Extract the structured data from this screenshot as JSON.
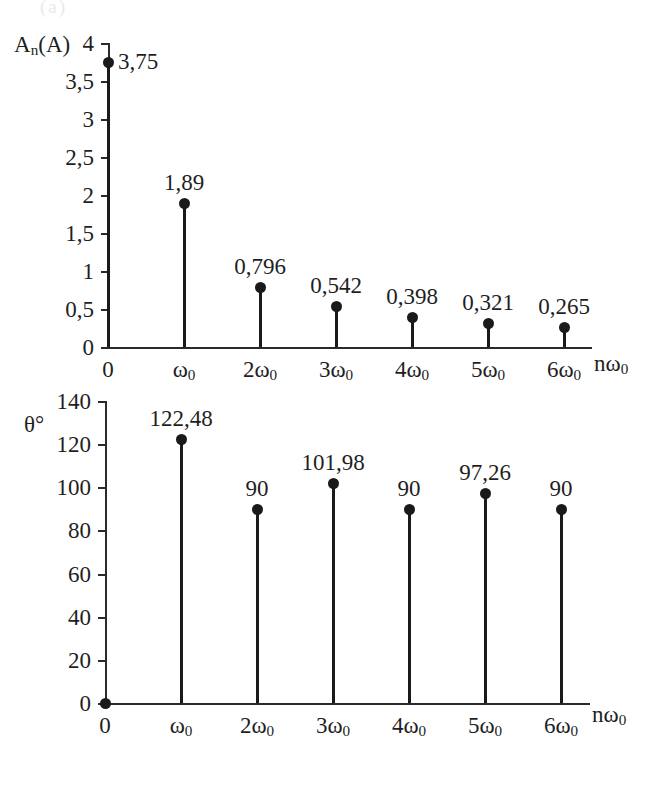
{
  "figure": {
    "cropped_caption_fragment": "(a)",
    "background_color": "#ffffff",
    "ink_color": "#1a1a1a"
  },
  "chart_data": [
    {
      "type": "bar",
      "style": "stem",
      "title": "",
      "subtitle": "",
      "xlabel": "nω0",
      "ylabel": "An(A)",
      "ylabel_display": "A",
      "ylabel_sub": "n",
      "ylabel_tail": "(A)",
      "categories": [
        "0",
        "ω0",
        "2ω0",
        "3ω0",
        "4ω0",
        "5ω0",
        "6ω0"
      ],
      "xtick_labels": [
        "0",
        "ω",
        "2ω",
        "3ω",
        "4ω",
        "5ω",
        "6ω"
      ],
      "xtick_subscript": "0",
      "values": [
        3.75,
        1.89,
        0.796,
        0.542,
        0.398,
        0.321,
        0.265
      ],
      "value_labels": [
        "3,75",
        "1,89",
        "0,796",
        "0,542",
        "0,398",
        "0,321",
        "0,265"
      ],
      "ylim": [
        0,
        4
      ],
      "ytick_values": [
        0,
        0.5,
        1,
        1.5,
        2,
        2.5,
        3,
        3.5,
        4
      ],
      "ytick_labels": [
        "0",
        "0,5",
        "1",
        "1,5",
        "2",
        "2,5",
        "3",
        "3,5",
        "4"
      ],
      "grid": false,
      "legend": "none",
      "first_label_position": "right-of-point"
    },
    {
      "type": "bar",
      "style": "stem",
      "title": "",
      "subtitle": "",
      "xlabel": "nω0",
      "ylabel": "θ°",
      "categories": [
        "0",
        "ω0",
        "2ω0",
        "3ω0",
        "4ω0",
        "5ω0",
        "6ω0"
      ],
      "xtick_labels": [
        "0",
        "ω",
        "2ω",
        "3ω",
        "4ω",
        "5ω",
        "6ω"
      ],
      "xtick_subscript": "0",
      "values": [
        0,
        122.48,
        90,
        101.98,
        90,
        97.26,
        90
      ],
      "value_labels": [
        "",
        "122,48",
        "90",
        "101,98",
        "90",
        "97,26",
        "90"
      ],
      "ylim": [
        0,
        140
      ],
      "ytick_values": [
        0,
        20,
        40,
        60,
        80,
        100,
        120,
        140
      ],
      "ytick_labels": [
        "0",
        "20",
        "40",
        "60",
        "80",
        "100",
        "120",
        "140"
      ],
      "grid": false,
      "legend": "none",
      "first_label_position": "none"
    }
  ]
}
